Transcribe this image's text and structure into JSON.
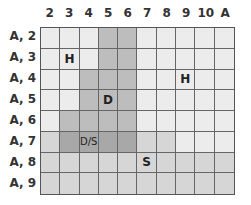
{
  "columns": [
    "2",
    "3",
    "4",
    "5",
    "6",
    "7",
    "8",
    "9",
    "10",
    "A"
  ],
  "rows": [
    "A, 2",
    "A, 3",
    "A, 4",
    "A, 5",
    "A, 6",
    "A, 7",
    "A, 8",
    "A, 9"
  ],
  "shade_colors": {
    "L": "#ececec",
    "M": "#d6d6d6",
    "D": "#bdbdbd",
    "DD": "#a8a8a8"
  },
  "cells": [
    [
      "L",
      "L",
      "L",
      "D",
      "D",
      "L",
      "L",
      "L",
      "L",
      "L"
    ],
    [
      "L",
      "L",
      "L",
      "D",
      "D",
      "L",
      "L",
      "L",
      "L",
      "L"
    ],
    [
      "L",
      "L",
      "D",
      "D",
      "D",
      "L",
      "L",
      "L",
      "L",
      "L"
    ],
    [
      "L",
      "L",
      "D",
      "D",
      "D",
      "L",
      "L",
      "L",
      "L",
      "L"
    ],
    [
      "L",
      "D",
      "D",
      "D",
      "D",
      "L",
      "L",
      "L",
      "L",
      "L"
    ],
    [
      "M",
      "DD",
      "DD",
      "DD",
      "DD",
      "M",
      "M",
      "L",
      "L",
      "L"
    ],
    [
      "M",
      "M",
      "M",
      "M",
      "M",
      "M",
      "M",
      "M",
      "M",
      "M"
    ],
    [
      "M",
      "M",
      "M",
      "M",
      "M",
      "M",
      "M",
      "M",
      "M",
      "M"
    ]
  ],
  "markers": [
    {
      "row": 1,
      "col": 1,
      "text": "H"
    },
    {
      "row": 2,
      "col": 7,
      "text": "H"
    },
    {
      "row": 3,
      "col": 3,
      "text": "D"
    },
    {
      "row": 5,
      "col": 2,
      "text": "D/S"
    },
    {
      "row": 6,
      "col": 5,
      "text": "S"
    }
  ]
}
